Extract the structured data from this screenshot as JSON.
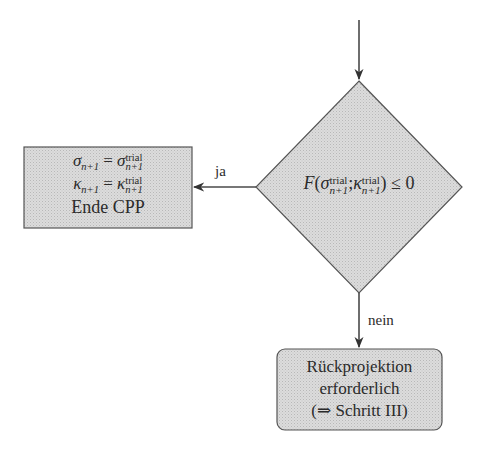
{
  "diagram": {
    "type": "flowchart",
    "colors": {
      "node_fill": "#d4d4d4",
      "stroke": "#555555",
      "text": "#2b2b2b",
      "background": "#ffffff"
    },
    "decision": {
      "id": "check-yield",
      "shape": "diamond",
      "condition": {
        "func": "F",
        "arg1_base": "σ",
        "arg1_sup": "trial",
        "arg1_sub": "n+1",
        "separator": ";",
        "arg2_base": "κ",
        "arg2_sup": "trial",
        "arg2_sub": "n+1",
        "relation": "≤ 0"
      }
    },
    "yes_node": {
      "id": "end-cpp",
      "shape": "rectangle",
      "line1": {
        "lhs": "σ",
        "lhs_sub": "n+1",
        "eq": "=",
        "rhs": "σ",
        "rhs_sup": "trial",
        "rhs_sub": "n+1"
      },
      "line2": {
        "lhs": "κ",
        "lhs_sub": "n+1",
        "eq": "=",
        "rhs": "κ",
        "rhs_sup": "trial",
        "rhs_sub": "n+1"
      },
      "line3": "Ende CPP"
    },
    "no_node": {
      "id": "return-mapping",
      "shape": "rounded-rectangle",
      "lines": [
        "Rückprojektion",
        "erforderlich",
        "(⇒ Schritt III)"
      ]
    },
    "edges": [
      {
        "from": "entry",
        "to": "check-yield",
        "label": ""
      },
      {
        "from": "check-yield",
        "to": "end-cpp",
        "label": "ja"
      },
      {
        "from": "check-yield",
        "to": "return-mapping",
        "label": "nein"
      }
    ]
  }
}
